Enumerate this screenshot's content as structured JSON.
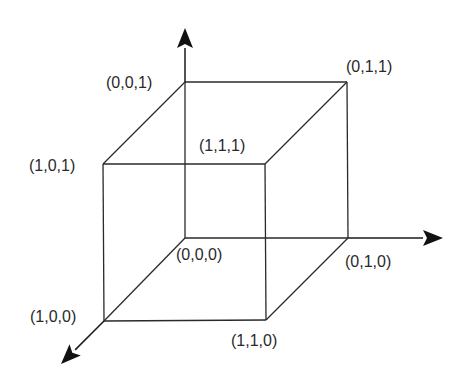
{
  "diagram": {
    "type": "unit-cube-coordinates",
    "vertices": [
      {
        "id": "v000",
        "label": "(0,0,0)"
      },
      {
        "id": "v010",
        "label": "(0,1,0)"
      },
      {
        "id": "v100",
        "label": "(1,0,0)"
      },
      {
        "id": "v110",
        "label": "(1,1,0)"
      },
      {
        "id": "v001",
        "label": "(0,0,1)"
      },
      {
        "id": "v011",
        "label": "(0,1,1)"
      },
      {
        "id": "v101",
        "label": "(1,0,1)"
      },
      {
        "id": "v111",
        "label": "(1,1,1)"
      }
    ],
    "edges": [
      [
        "v001",
        "v011"
      ],
      [
        "v001",
        "v101"
      ],
      [
        "v011",
        "v111"
      ],
      [
        "v101",
        "v111"
      ],
      [
        "v000",
        "v010"
      ],
      [
        "v000",
        "v100"
      ],
      [
        "v010",
        "v110"
      ],
      [
        "v100",
        "v110"
      ],
      [
        "v000",
        "v001"
      ],
      [
        "v010",
        "v011"
      ],
      [
        "v100",
        "v101"
      ],
      [
        "v110",
        "v111"
      ]
    ],
    "axes": [
      {
        "name": "x-axis",
        "direction": "toward-viewer-lower-left"
      },
      {
        "name": "y-axis",
        "direction": "right"
      },
      {
        "name": "z-axis",
        "direction": "up"
      }
    ]
  }
}
